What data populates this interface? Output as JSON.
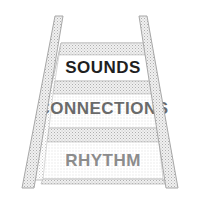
{
  "illustration": {
    "title": "Stairs diagram",
    "type": "perspective-staircase",
    "background_color": "#ffffff",
    "texture": "halftone-dot-stipple",
    "rail": {
      "name": "handrail",
      "fill_color": "#e6e6e6",
      "stroke_color": "#b0b0b0"
    },
    "tread_fill_color": "#ececec",
    "tread_stroke_color": "#bdbdbd"
  },
  "steps": [
    {
      "id": "step-sounds",
      "label": "SOUNDS",
      "order": 1,
      "position": "top",
      "panel_fill_color": "#ffffff",
      "text_color": "#1f1f1f",
      "font_size": 17
    },
    {
      "id": "step-connections",
      "label": "CONNECTIONS",
      "order": 2,
      "position": "middle",
      "panel_fill_color": "#efefef",
      "text_color": "#6a6a6a",
      "font_size": 17
    },
    {
      "id": "step-rhythm",
      "label": "RHYTHM",
      "order": 3,
      "position": "bottom",
      "panel_fill_color": "#f2f2f2",
      "text_color": "#8c8c8c",
      "font_size": 17
    }
  ]
}
